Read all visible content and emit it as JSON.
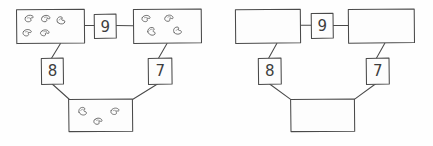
{
  "figure": {
    "background_color": "#fefefe",
    "ink_color": "#4a4a4a",
    "bean_fill_color": "#fcfcfc",
    "bean_outline_color": "#5a5a5a"
  },
  "panels": [
    {
      "id": "left-panel",
      "name": "filled-diagram",
      "boxes": [
        {
          "id": "top-left-box",
          "name": "top-left-container",
          "bean_count": 5,
          "x": 16,
          "y": 9,
          "w": 68,
          "h": 34
        },
        {
          "id": "top-right-box",
          "name": "top-right-container",
          "bean_count": 4,
          "x": 133,
          "y": 9,
          "w": 68,
          "h": 34
        },
        {
          "id": "bottom-box",
          "name": "bottom-container",
          "bean_count": 3,
          "x": 68,
          "y": 98,
          "w": 64,
          "h": 33
        }
      ],
      "labels": [
        {
          "id": "label-9",
          "name": "connector-label-9",
          "value": "9",
          "x": 94,
          "y": 14,
          "w": 22,
          "h": 24
        },
        {
          "id": "label-8",
          "name": "connector-label-8",
          "value": "8",
          "x": 41,
          "y": 58,
          "w": 22,
          "h": 26
        },
        {
          "id": "label-7",
          "name": "connector-label-7",
          "value": "7",
          "x": 148,
          "y": 58,
          "w": 24,
          "h": 26
        }
      ],
      "connectors": [
        {
          "id": "conn-topleft-to-9",
          "name": "edge-topleft-label9",
          "from": "top-left-box",
          "to": "label-9"
        },
        {
          "id": "conn-9-to-topright",
          "name": "edge-label9-topright",
          "from": "label-9",
          "to": "top-right-box"
        },
        {
          "id": "conn-topleft-to-8",
          "name": "edge-topleft-label8",
          "from": "top-left-box",
          "to": "label-8"
        },
        {
          "id": "conn-8-to-bottom",
          "name": "edge-label8-bottom",
          "from": "label-8",
          "to": "bottom-box"
        },
        {
          "id": "conn-topright-to-7",
          "name": "edge-topright-label7",
          "from": "top-right-box",
          "to": "label-7"
        },
        {
          "id": "conn-7-to-bottom",
          "name": "edge-label7-bottom",
          "from": "label-7",
          "to": "bottom-box"
        }
      ]
    },
    {
      "id": "right-panel",
      "name": "empty-diagram",
      "boxes": [
        {
          "id": "top-left-box-2",
          "name": "top-left-container-empty",
          "bean_count": 0,
          "x": 235,
          "y": 9,
          "w": 65,
          "h": 34
        },
        {
          "id": "top-right-box-2",
          "name": "top-right-container-empty",
          "bean_count": 0,
          "x": 348,
          "y": 9,
          "w": 66,
          "h": 34
        },
        {
          "id": "bottom-box-2",
          "name": "bottom-container-empty",
          "bean_count": 0,
          "x": 290,
          "y": 98,
          "w": 64,
          "h": 33
        }
      ],
      "labels": [
        {
          "id": "label-9-b",
          "name": "connector-label-9",
          "value": "9",
          "x": 311,
          "y": 13,
          "w": 22,
          "h": 25
        },
        {
          "id": "label-8-b",
          "name": "connector-label-8",
          "value": "8",
          "x": 258,
          "y": 58,
          "w": 23,
          "h": 26
        },
        {
          "id": "label-7-b",
          "name": "connector-label-7",
          "value": "7",
          "x": 366,
          "y": 58,
          "w": 23,
          "h": 26
        }
      ],
      "connectors": [
        {
          "id": "conn-topleft-to-9-b",
          "name": "edge-topleft-label9",
          "from": "top-left-box-2",
          "to": "label-9-b"
        },
        {
          "id": "conn-9-to-topright-b",
          "name": "edge-label9-topright",
          "from": "label-9-b",
          "to": "top-right-box-2"
        },
        {
          "id": "conn-topleft-to-8-b",
          "name": "edge-topleft-label8",
          "from": "top-left-box-2",
          "to": "label-8-b"
        },
        {
          "id": "conn-8-to-bottom-b",
          "name": "edge-label8-bottom",
          "from": "label-8-b",
          "to": "bottom-box-2"
        },
        {
          "id": "conn-topright-to-7-b",
          "name": "edge-topright-label7",
          "from": "top-right-box-2",
          "to": "label-7-b"
        },
        {
          "id": "conn-7-to-bottom-b",
          "name": "edge-label7-bottom",
          "from": "label-7-b",
          "to": "bottom-box-2"
        }
      ]
    }
  ],
  "label_values": {
    "nine": "9",
    "eight": "8",
    "seven": "7",
    "nine_b": "9",
    "eight_b": "8",
    "seven_b": "7"
  }
}
